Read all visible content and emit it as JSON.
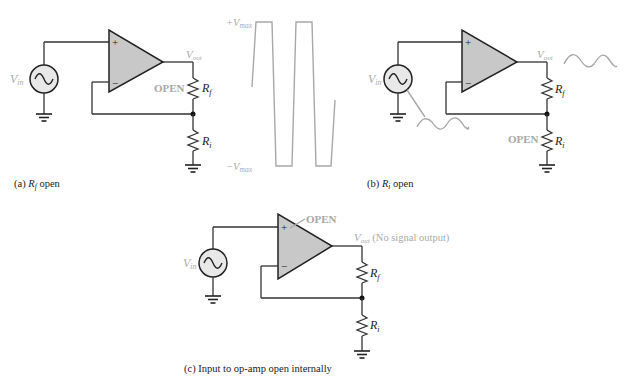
{
  "diagram": {
    "panel_a": {
      "caption_prefix": "(a) ",
      "caption_symbol": "R",
      "caption_sub": "f",
      "caption_suffix": " open",
      "source_label": "V",
      "source_sub": "in",
      "plus": "+",
      "minus": "−",
      "output_label": "V",
      "output_sub": "out",
      "open_label": "OPEN",
      "rf_label": "R",
      "rf_sub": "f",
      "ri_label": "R",
      "ri_sub": "i"
    },
    "waveform": {
      "pos_label": "+V",
      "pos_sub": "max",
      "neg_label": "−V",
      "neg_sub": "max"
    },
    "panel_b": {
      "caption_prefix": "(b) ",
      "caption_symbol": "R",
      "caption_sub": "i",
      "caption_suffix": " open",
      "source_label": "V",
      "source_sub": "in",
      "plus": "+",
      "minus": "−",
      "output_label": "V",
      "output_sub": "out",
      "open_label": "OPEN",
      "rf_label": "R",
      "rf_sub": "f",
      "ri_label": "R",
      "ri_sub": "i"
    },
    "panel_c": {
      "caption": "(c) Input to op-amp open internally",
      "source_label": "V",
      "source_sub": "in",
      "plus": "+",
      "minus": "−",
      "open_label": "OPEN",
      "output_label": "V",
      "output_sub": "out",
      "output_note": " (No signal output)",
      "rf_label": "R",
      "rf_sub": "f",
      "ri_label": "R",
      "ri_sub": "i"
    },
    "colors": {
      "wire": "#333333",
      "opamp_fill": "#c8c8c8",
      "annotation_gray": "#aaaaaa"
    }
  }
}
